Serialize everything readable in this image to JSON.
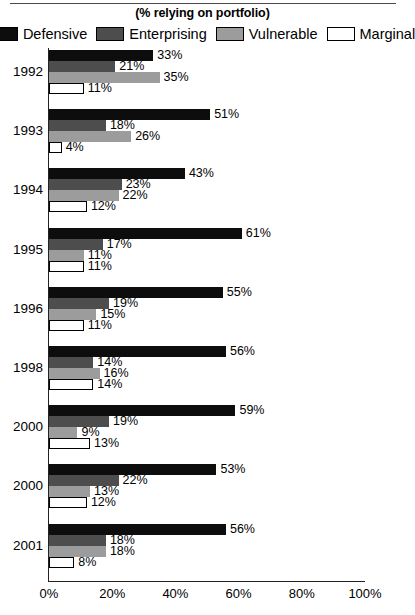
{
  "chart_data": {
    "type": "bar",
    "orientation": "horizontal",
    "title": "(% relying on portfolio)",
    "xlabel": "",
    "ylabel": "",
    "xlim": [
      0,
      100
    ],
    "xticks": [
      "0%",
      "20%",
      "40%",
      "60%",
      "80%",
      "100%"
    ],
    "xtick_values": [
      0,
      20,
      40,
      60,
      80,
      100
    ],
    "grid": false,
    "legend_position": "top",
    "categories": [
      "1992",
      "1993",
      "1994",
      "1995",
      "1996",
      "1998",
      "2000",
      "2000",
      "2001"
    ],
    "series": [
      {
        "name": "Defensive",
        "color": "#0d0d0d",
        "values": [
          33,
          51,
          43,
          61,
          55,
          56,
          59,
          53,
          56
        ],
        "labels": [
          "33%",
          "51%",
          "43%",
          "61%",
          "55%",
          "56%",
          "59%",
          "53%",
          "56%"
        ]
      },
      {
        "name": "Enterprising",
        "color": "#4d4d4d",
        "values": [
          21,
          18,
          23,
          17,
          19,
          14,
          19,
          22,
          18
        ],
        "labels": [
          "21%",
          "18%",
          "23%",
          "17%",
          "19%",
          "14%",
          "19%",
          "22%",
          "18%"
        ]
      },
      {
        "name": "Vulnerable",
        "color": "#9c9c9c",
        "values": [
          35,
          26,
          22,
          11,
          15,
          16,
          9,
          13,
          18
        ],
        "labels": [
          "35%",
          "26%",
          "22%",
          "11%",
          "15%",
          "16%",
          "9%",
          "13%",
          "18%"
        ]
      },
      {
        "name": "Marginal",
        "color": "#ffffff",
        "values": [
          11,
          4,
          12,
          11,
          11,
          14,
          13,
          12,
          8
        ],
        "labels": [
          "11%",
          "4%",
          "12%",
          "11%",
          "11%",
          "14%",
          "13%",
          "12%",
          "8%"
        ]
      }
    ]
  },
  "legend": {
    "items": [
      {
        "label": "Defensive",
        "color": "#0d0d0d"
      },
      {
        "label": "Enterprising",
        "color": "#4d4d4d"
      },
      {
        "label": "Vulnerable",
        "color": "#9c9c9c"
      },
      {
        "label": "Marginal",
        "color": "#ffffff"
      }
    ]
  }
}
